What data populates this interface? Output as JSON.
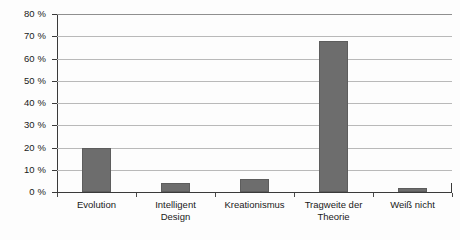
{
  "chart_data": {
    "type": "bar",
    "title": "",
    "xlabel": "",
    "ylabel": "",
    "categories": [
      "Evolution",
      "Intelligent Design",
      "Kreationismus",
      "Tragweite der Theorie",
      "Weiß nicht"
    ],
    "category_labels_wrapped": [
      "Evolution",
      "Intelligent\nDesign",
      "Kreationismus",
      "Tragweite der\nTheorie",
      "Weiß nicht"
    ],
    "values": [
      20,
      4,
      6,
      68,
      2
    ],
    "ylim": [
      0,
      80
    ],
    "ytick_values": [
      0,
      10,
      20,
      30,
      40,
      50,
      60,
      70,
      80
    ],
    "ytick_labels": [
      "0 %",
      "10 %",
      "20 %",
      "30 %",
      "40 %",
      "50 %",
      "60 %",
      "70 %",
      "80 %"
    ],
    "grid": true,
    "legend": null,
    "legend_position": "none",
    "bar_color": "#6d6d6d",
    "gridline_color": "#b9b9b9",
    "axis_color": "#3a3a3a",
    "background_color": "#fdfdfd"
  }
}
